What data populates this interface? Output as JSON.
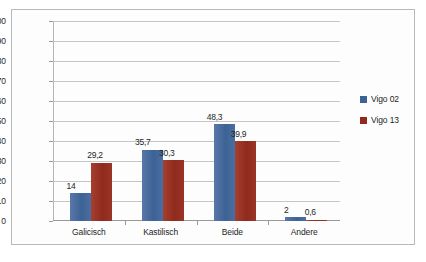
{
  "chart_data": {
    "type": "bar",
    "title": "",
    "subtitle": "",
    "xlabel": "",
    "ylabel": "",
    "categories": [
      "Galicisch",
      "Kastilisch",
      "Beide",
      "Andere"
    ],
    "series": [
      {
        "name": "Vigo 02",
        "color": "#3d6295",
        "values": [
          14,
          35.7,
          48.3,
          2
        ],
        "labels": [
          "14",
          "35,7",
          "48,3",
          "2"
        ]
      },
      {
        "name": "Vigo 13",
        "color": "#92291c",
        "values": [
          29.2,
          30.3,
          39.9,
          0.6
        ],
        "labels": [
          "29,2",
          "30,3",
          "39,9",
          "0,6"
        ]
      }
    ],
    "ylim": [
      0,
      100
    ],
    "yticks": [
      0,
      10,
      20,
      30,
      40,
      50,
      60,
      70,
      80,
      90,
      100
    ],
    "ytick_labels": [
      "0",
      "10",
      "20",
      "30",
      "40",
      "50",
      "60",
      "70",
      "80",
      "90",
      "100"
    ],
    "grid": true,
    "legend_position": "right"
  }
}
